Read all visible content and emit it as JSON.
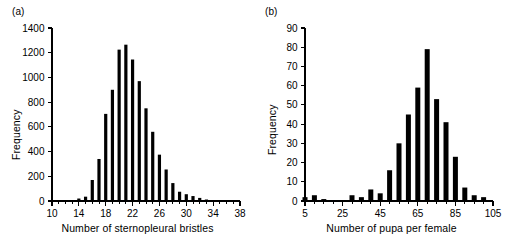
{
  "figure": {
    "panel_a_tag": "(a)",
    "panel_b_tag": "(b)"
  },
  "chart_data": [
    {
      "type": "bar",
      "panel": "(a)",
      "title": "",
      "xlabel": "Number of sternopleural bristles",
      "ylabel": "Frequency",
      "xlim": [
        10,
        38
      ],
      "ylim": [
        0,
        1400
      ],
      "xticks": [
        10,
        14,
        18,
        22,
        26,
        30,
        34,
        38
      ],
      "xtick_labels": [
        "10",
        "14",
        "18",
        "22",
        "26",
        "30",
        "34",
        "38"
      ],
      "xtick_minor_step": 1,
      "yticks": [
        0,
        200,
        400,
        600,
        800,
        1000,
        1200,
        1400
      ],
      "ytick_labels": [
        "0",
        "200",
        "400",
        "600",
        "800",
        "1000",
        "1200",
        "1400"
      ],
      "grid": false,
      "legend": "none",
      "bar_color": "#000000",
      "categories": [
        10,
        11,
        12,
        13,
        14,
        15,
        16,
        17,
        18,
        19,
        20,
        21,
        22,
        23,
        24,
        25,
        26,
        27,
        28,
        29,
        30,
        31,
        32,
        33,
        34,
        35,
        36,
        37,
        38
      ],
      "values": [
        0,
        0,
        0,
        0,
        20,
        35,
        170,
        340,
        705,
        900,
        1225,
        1265,
        1145,
        970,
        750,
        560,
        375,
        255,
        145,
        75,
        55,
        40,
        25,
        12,
        0,
        0,
        0,
        0,
        0
      ]
    },
    {
      "type": "bar",
      "panel": "(b)",
      "title": "",
      "xlabel": "Number of pupa per female",
      "ylabel": "Frequency",
      "xlim": [
        5,
        105
      ],
      "ylim": [
        0,
        90
      ],
      "xticks": [
        5,
        25,
        45,
        65,
        85,
        105
      ],
      "xtick_labels": [
        "5",
        "25",
        "45",
        "65",
        "85",
        "105"
      ],
      "xtick_minor_step": 5,
      "yticks": [
        0,
        10,
        20,
        30,
        40,
        50,
        60,
        70,
        80,
        90
      ],
      "ytick_labels": [
        "0",
        "10",
        "20",
        "30",
        "40",
        "50",
        "60",
        "70",
        "80",
        "90"
      ],
      "grid": false,
      "legend": "none",
      "bar_color": "#000000",
      "categories": [
        5,
        10,
        15,
        20,
        25,
        30,
        35,
        40,
        45,
        50,
        55,
        60,
        65,
        70,
        75,
        80,
        85,
        90,
        95,
        100
      ],
      "values": [
        2,
        3,
        1,
        0,
        0,
        3,
        2,
        6,
        4,
        16,
        30,
        45,
        59,
        79,
        53,
        41,
        23,
        7,
        3,
        2
      ]
    }
  ]
}
